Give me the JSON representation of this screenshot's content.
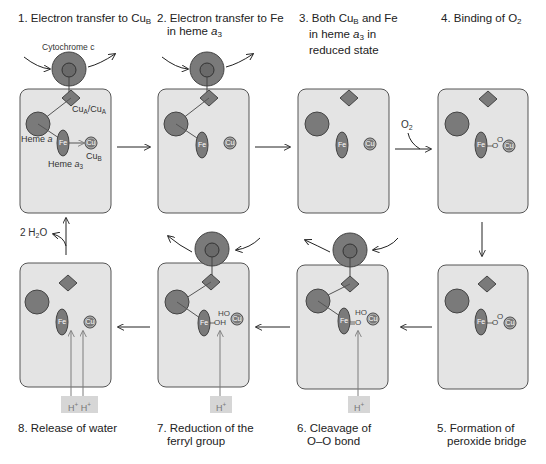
{
  "figure": {
    "colors": {
      "box_fill": "#e4e4e4",
      "box_stroke": "#555555",
      "heme_fill": "#7a7a7a",
      "heme_stroke": "#444444",
      "proton_box": "#d6d6d6",
      "proton_line": "#7d7d7d",
      "arrow": "#222222"
    },
    "steps": [
      {
        "id": 1,
        "num": "1.",
        "line1": "Electron transfer to Cu",
        "line1_sub": "B",
        "line2": ""
      },
      {
        "id": 2,
        "num": "2.",
        "line1": "Electron transfer to Fe",
        "line2_pre": "in heme ",
        "line2_ital": "a",
        "line2_sub": "3"
      },
      {
        "id": 3,
        "num": "3.",
        "line1_pre": "Both Cu",
        "line1_sub": "B",
        "line1_post": " and Fe",
        "line2_pre": "in heme ",
        "line2_ital": "a",
        "line2_sub": "3",
        "line2_post": " in",
        "line3": "reduced state"
      },
      {
        "id": 4,
        "num": "4.",
        "line1_pre": "Binding of O",
        "line1_sub": "2"
      },
      {
        "id": 5,
        "num": "5.",
        "line1": "Formation of",
        "line2": "peroxide bridge"
      },
      {
        "id": 6,
        "num": "6.",
        "line1": "Cleavage of",
        "line2": "O–O bond"
      },
      {
        "id": 7,
        "num": "7.",
        "line1": "Reduction of the",
        "line2": "ferryl group"
      },
      {
        "id": 8,
        "num": "8.",
        "line1": "Release of water"
      }
    ],
    "annotations": {
      "cytochrome_c": "Cytochrome c",
      "cua_label_a": "Cu",
      "cua_sub_a": "A",
      "cua_sep": "/Cu",
      "cua_sub_b": "A",
      "heme_a": "Heme ",
      "heme_a_ital": "a",
      "heme_a3": "Heme ",
      "heme_a3_ital": "a",
      "heme_a3_sub": "3",
      "cub": "Cu",
      "cub_sub": "B",
      "fe": "Fe",
      "cu": "Cu",
      "o2_in": "O",
      "o2_in_sub": "2",
      "water_out_pre": "2 H",
      "water_out_sub": "2",
      "water_out_post": "O",
      "proton": "H",
      "proton_sup": "+",
      "oxygen": "O",
      "hydroxyl_ho": "HO",
      "hydroxyl_oh": "OH",
      "ferryl_o": "O"
    }
  }
}
